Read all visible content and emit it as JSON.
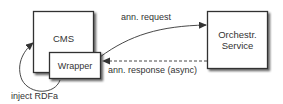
{
  "diagram": {
    "nodes": {
      "cms": {
        "label": "CMS"
      },
      "wrapper": {
        "label": "Wrapper"
      },
      "orchestrator": {
        "label_line1": "Orchestr.",
        "label_line2": "Service"
      }
    },
    "edges": {
      "request": {
        "label": "ann. request",
        "style": "solid"
      },
      "response": {
        "label": "ann. response (async)",
        "style": "dashed"
      },
      "inject": {
        "label": "inject RDFa",
        "style": "solid"
      }
    },
    "colors": {
      "stroke": "#333333",
      "fill": "#ffffff",
      "shadow": "#888888"
    }
  }
}
